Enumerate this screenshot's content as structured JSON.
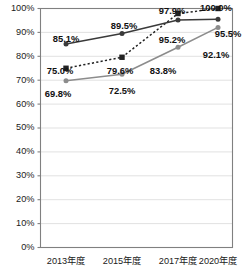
{
  "chart_data": {
    "type": "line",
    "title": "",
    "subtitle": "",
    "xlabel": "",
    "ylabel": "",
    "categories": [
      "2013年度",
      "2015年度",
      "2017年度",
      "2020年度"
    ],
    "ylim": [
      0,
      100
    ],
    "ytick_labels": [
      "100%",
      "90%",
      "80%",
      "70%",
      "60%",
      "50%",
      "40%",
      "30%",
      "20%",
      "10%",
      "0%"
    ],
    "ytick_values": [
      100,
      90,
      80,
      70,
      60,
      50,
      40,
      30,
      20,
      10,
      0
    ],
    "grid": true,
    "legend": "none",
    "series": [
      {
        "name": "series-dotted-square",
        "marker": "square",
        "line_style": "dotted",
        "color": "#222222",
        "values": [
          75.0,
          79.6,
          97.9,
          100.0
        ],
        "labels": [
          "75.0%",
          "79.6%",
          "97.9%",
          "100.0%"
        ]
      },
      {
        "name": "series-solid-dark-circle",
        "marker": "circle",
        "line_style": "solid",
        "color": "#3a3a3a",
        "values": [
          85.1,
          89.5,
          95.2,
          95.5
        ],
        "labels": [
          "85.1%",
          "89.5%",
          "95.2%",
          "95.5%"
        ]
      },
      {
        "name": "series-solid-gray-circle",
        "marker": "circle",
        "line_style": "solid",
        "color": "#8c8c8c",
        "values": [
          69.8,
          72.5,
          83.8,
          92.1
        ],
        "labels": [
          "69.8%",
          "72.5%",
          "83.8%",
          "92.1%"
        ]
      }
    ],
    "data_labels": [
      {
        "text": "85.1%",
        "x": 66,
        "y": 40
      },
      {
        "text": "89.5%",
        "x": 124,
        "y": 27
      },
      {
        "text": "97.9%",
        "x": 172,
        "y": 12
      },
      {
        "text": "100.0%",
        "x": 216,
        "y": 9
      },
      {
        "text": "95.5%",
        "x": 228,
        "y": 35
      },
      {
        "text": "95.2%",
        "x": 172,
        "y": 41
      },
      {
        "text": "92.1%",
        "x": 216,
        "y": 56
      },
      {
        "text": "83.8%",
        "x": 163,
        "y": 72
      },
      {
        "text": "79.6%",
        "x": 120,
        "y": 72
      },
      {
        "text": "75.0%",
        "x": 60,
        "y": 72
      },
      {
        "text": "72.5%",
        "x": 122,
        "y": 92
      },
      {
        "text": "69.8%",
        "x": 58,
        "y": 95
      }
    ],
    "colors": {
      "grid": "#d9d9d9",
      "axis": "#808080",
      "text": "#1a1a1a",
      "background": "#ffffff"
    }
  }
}
